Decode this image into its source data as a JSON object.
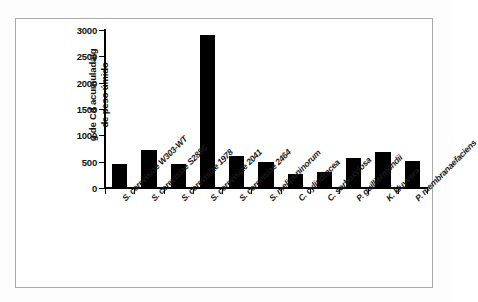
{
  "chart_data": {
    "type": "bar",
    "title": "",
    "xlabel": "",
    "ylabel": "g de Cd acumulada/g\nde peso úmido",
    "ylim": [
      0,
      3000
    ],
    "ytick_values": [
      0,
      500,
      1000,
      1500,
      2000,
      2500,
      3000
    ],
    "ytick_labels": [
      "0",
      "500",
      "1000",
      "1500",
      "2000",
      "2500",
      "3000"
    ],
    "grid": false,
    "legend": "none",
    "bar_color": "#000000",
    "categories": [
      "S. cerevisiae W303-WT",
      "S. cerevisiae S288C",
      "S. cerevisiae 1978",
      "S. cerevisiae 2041",
      "S. cerevisiae 2464",
      "S. meliponinorum",
      "C. cylindracea",
      "C. sorboxylosa",
      "P. guilliermondii",
      "K. kluyvera",
      "P. membranaefaciens"
    ],
    "values": [
      460,
      720,
      450,
      2900,
      610,
      490,
      270,
      310,
      565,
      690,
      505
    ]
  },
  "figure": {
    "frame_color": "#a9a9a9",
    "background": "#ffffff"
  }
}
